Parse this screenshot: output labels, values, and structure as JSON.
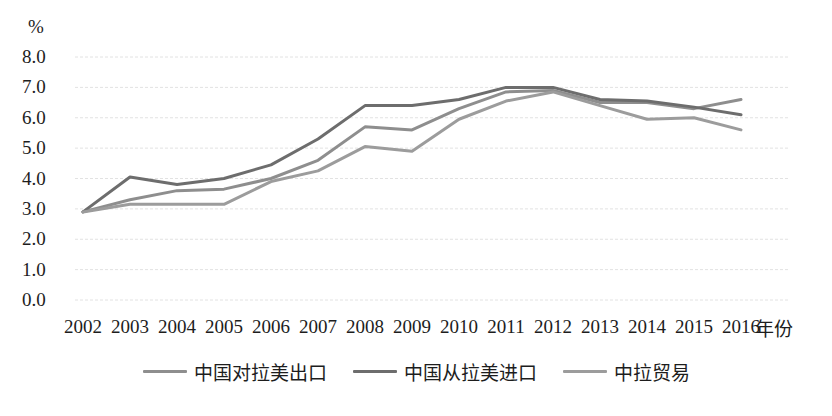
{
  "chart_data": {
    "type": "line",
    "title": "",
    "subtitle": "",
    "xlabel": "年份",
    "ylabel": "%",
    "yunit": "%",
    "grid": true,
    "legend_position": "bottom",
    "x": [
      "2002",
      "2003",
      "2004",
      "2005",
      "2006",
      "2007",
      "2008",
      "2009",
      "2010",
      "2011",
      "2012",
      "2013",
      "2014",
      "2015",
      "2016"
    ],
    "categories": [
      "2002",
      "2003",
      "2004",
      "2005",
      "2006",
      "2007",
      "2008",
      "2009",
      "2010",
      "2011",
      "2012",
      "2013",
      "2014",
      "2015",
      "2016"
    ],
    "ylim": [
      0.0,
      8.0
    ],
    "ytick_labels": [
      "0.0",
      "1.0",
      "2.0",
      "3.0",
      "4.0",
      "5.0",
      "6.0",
      "7.0",
      "8.0"
    ],
    "ytick_values": [
      0.0,
      1.0,
      2.0,
      3.0,
      4.0,
      5.0,
      6.0,
      7.0,
      8.0
    ],
    "series": [
      {
        "name": "中国对拉美出口",
        "color": "#8e8e8e",
        "values": [
          2.9,
          3.3,
          3.6,
          3.65,
          4.0,
          4.6,
          5.7,
          5.6,
          6.3,
          6.85,
          6.9,
          6.5,
          6.5,
          6.3,
          6.6
        ]
      },
      {
        "name": "中国从拉美进口",
        "color": "#6d6d6d",
        "values": [
          2.9,
          4.05,
          3.8,
          4.0,
          4.45,
          5.3,
          6.4,
          6.4,
          6.6,
          7.0,
          7.0,
          6.6,
          6.55,
          6.35,
          6.1
        ]
      },
      {
        "name": "中拉贸易",
        "color": "#9c9c9c",
        "values": [
          2.9,
          3.15,
          3.15,
          3.15,
          3.9,
          4.25,
          5.05,
          4.9,
          5.95,
          6.55,
          6.85,
          6.4,
          5.95,
          6.0,
          5.6
        ]
      }
    ]
  },
  "axes": {
    "unit_label": "%",
    "x_title": "年份"
  },
  "legend": {
    "items": [
      {
        "label": "中国对拉美出口",
        "color": "#8e8e8e"
      },
      {
        "label": "中国从拉美进口",
        "color": "#6d6d6d"
      },
      {
        "label": "中拉贸易",
        "color": "#9c9c9c"
      }
    ]
  }
}
